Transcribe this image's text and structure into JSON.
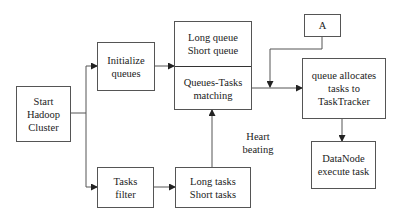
{
  "diagram": {
    "nodes": {
      "start": {
        "line1": "Start",
        "line2": "Hadoop",
        "line3": "Cluster"
      },
      "init": {
        "line1": "Initialize",
        "line2": "queues"
      },
      "queues": {
        "top_line1": "Long queue",
        "top_line2": "Short queue",
        "bottom_line1": "Queues-Tasks",
        "bottom_line2": "matching"
      },
      "a": {
        "label": "A"
      },
      "allocate": {
        "line1": "queue allocates",
        "line2": "tasks to",
        "line3": "TaskTracker"
      },
      "datanode": {
        "line1": "DataNode",
        "line2": "execute task"
      },
      "filter": {
        "line1": "Tasks",
        "line2": "filter"
      },
      "tasks": {
        "line1": "Long tasks",
        "line2": "Short tasks"
      }
    },
    "edge_labels": {
      "heartbeat_line1": "Heart",
      "heartbeat_line2": "beating"
    },
    "colors": {
      "line": "#555555",
      "background": "#ffffff"
    }
  }
}
